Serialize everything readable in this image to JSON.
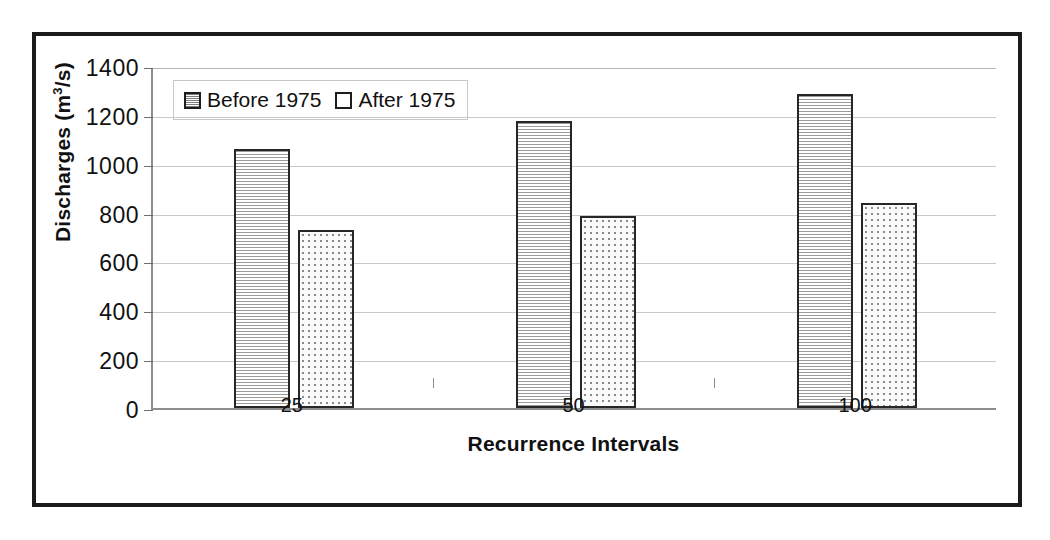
{
  "chart_data": {
    "type": "bar",
    "title": "",
    "xlabel": "Recurrence Intervals",
    "ylabel": "Discharges (m3/s)",
    "ylabel_main": "Discharges (m",
    "ylabel_sup": "3",
    "ylabel_tail": "/s)",
    "categories": [
      "25",
      "50",
      "100"
    ],
    "series": [
      {
        "name": "Before 1975",
        "values": [
          1060,
          1175,
          1285
        ],
        "pattern": "horizontal-lines"
      },
      {
        "name": "After 1975",
        "values": [
          730,
          785,
          840
        ],
        "pattern": "dots"
      }
    ],
    "ylim": [
      0,
      1400
    ],
    "yticks": [
      "0",
      "200",
      "400",
      "600",
      "800",
      "1000",
      "1200",
      "1400"
    ],
    "ytick_values": [
      0,
      200,
      400,
      600,
      800,
      1000,
      1200,
      1400
    ],
    "grid": true,
    "legend_position": "top-left-inside",
    "colors": {
      "bar_border": "#262626",
      "grid": "#c9c9c9",
      "axis": "#8d8d8d",
      "frame": "#1b1b1b",
      "text": "#111111",
      "background": "#ffffff"
    }
  },
  "legend": {
    "entries": [
      {
        "label": "Before 1975"
      },
      {
        "label": "After 1975"
      }
    ]
  },
  "axes": {
    "y_title_prefix": "Discharges (m",
    "y_title_sup": "3",
    "y_title_suffix": "/s)",
    "x_title": "Recurrence Intervals"
  }
}
